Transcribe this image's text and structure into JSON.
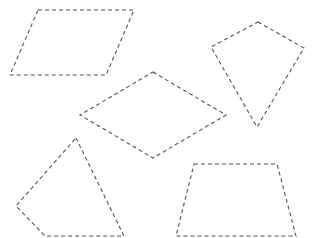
{
  "canvas": {
    "width": 314,
    "height": 238,
    "background": "#ffffff"
  },
  "style": {
    "stroke": "#555555",
    "dash": "4 3"
  },
  "shapes": [
    {
      "name": "parallelogram",
      "points": "38,10 134,10 106,75 10,75"
    },
    {
      "name": "kite",
      "points": "258,22 304,48 257,127 211,47"
    },
    {
      "name": "rhombus",
      "points": "153,72 226,115 153,158 80,115"
    },
    {
      "name": "quadrilateral",
      "points": "76,138 124,236 45,236 16,206"
    },
    {
      "name": "trapezoid",
      "points": "194,164 277,164 296,236 176,236"
    }
  ]
}
